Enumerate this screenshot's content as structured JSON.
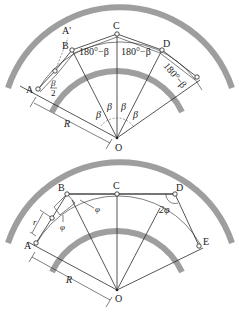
{
  "top_diagram": {
    "points": [
      "A",
      "A'",
      "B",
      "C",
      "D",
      "O"
    ],
    "angle_labels": {
      "beta": "β",
      "half_beta_num": "β",
      "half_beta_den": "2",
      "supplement": "180°−β"
    },
    "dimension_label": "R"
  },
  "bottom_diagram": {
    "points": [
      "A",
      "B",
      "C",
      "D",
      "E",
      "O"
    ],
    "angle_labels": {
      "phi": "φ",
      "two_phi": "2φ"
    },
    "small_dim_label": "r",
    "dimension_label": "R"
  },
  "colors": {
    "band": "#9e9e9e",
    "line": "#2a2a2a",
    "background": "#ffffff"
  }
}
